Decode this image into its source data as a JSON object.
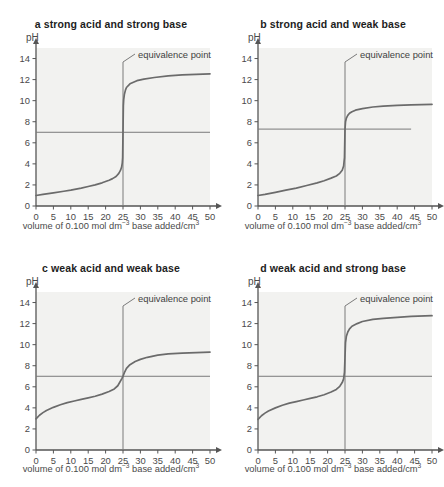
{
  "figure": {
    "axis_label_y": "pH",
    "axis_label_x_pre": "volume of 0.100 mol dm",
    "axis_label_x_sup": "−3",
    "axis_label_x_mid": " base added/cm",
    "axis_label_x_sup2": "3",
    "annotation": "equivalence point",
    "colors": {
      "plot_background": "#f2f2f0",
      "curve": "#6b6b6b",
      "axis": "#555555",
      "reference_line": "#7a7a7a",
      "title": "#1d1d1d",
      "tick_label": "#4a4a4a"
    }
  },
  "chart_data": [
    {
      "type": "line",
      "panel": "a",
      "title": "a strong acid and strong base",
      "xlabel": "volume of 0.100 mol dm-3 base added/cm3",
      "ylabel": "pH",
      "xlim": [
        0,
        50
      ],
      "ylim": [
        0,
        15
      ],
      "xticks": [
        0,
        5,
        10,
        15,
        20,
        25,
        30,
        35,
        40,
        45,
        50
      ],
      "yticks": [
        0,
        2,
        4,
        6,
        8,
        10,
        12,
        14
      ],
      "grid": false,
      "equivalence_point_volume": 25,
      "equivalence_point_ph": 7,
      "reference_line_ph": 7,
      "reference_line_x_end": 50,
      "annotation": "equivalence point",
      "x": [
        0,
        2,
        5,
        8,
        10,
        13,
        15,
        17,
        19,
        21,
        22,
        23,
        23.8,
        24.3,
        24.6,
        24.8,
        24.9,
        25,
        25.1,
        25.2,
        25.4,
        25.7,
        26,
        27,
        29,
        31,
        34,
        38,
        42,
        46,
        50
      ],
      "y": [
        1.0,
        1.1,
        1.25,
        1.4,
        1.5,
        1.7,
        1.85,
        2.0,
        2.2,
        2.45,
        2.6,
        2.8,
        3.1,
        3.4,
        3.7,
        4.1,
        4.6,
        7.0,
        9.5,
        10.1,
        10.6,
        11.0,
        11.25,
        11.6,
        11.9,
        12.05,
        12.2,
        12.35,
        12.45,
        12.5,
        12.55
      ]
    },
    {
      "type": "line",
      "panel": "b",
      "title": "b strong acid and weak base",
      "xlabel": "volume of 0.100 mol dm-3 base added/cm3",
      "ylabel": "pH",
      "xlim": [
        0,
        50
      ],
      "ylim": [
        0,
        15
      ],
      "xticks": [
        0,
        5,
        10,
        15,
        20,
        25,
        30,
        35,
        40,
        45,
        50
      ],
      "yticks": [
        0,
        2,
        4,
        6,
        8,
        10,
        12,
        14
      ],
      "grid": false,
      "equivalence_point_volume": 25,
      "equivalence_point_ph": 7.3,
      "reference_line_ph": 7.3,
      "reference_line_x_end": 44,
      "annotation": "equivalence point",
      "x": [
        0,
        2,
        5,
        8,
        11,
        14,
        17,
        19,
        21,
        22.5,
        23.5,
        24.2,
        24.6,
        24.85,
        25,
        25.15,
        25.4,
        25.8,
        26.3,
        27,
        28,
        30,
        33,
        36,
        40,
        44,
        47,
        50
      ],
      "y": [
        1.0,
        1.1,
        1.3,
        1.5,
        1.7,
        1.95,
        2.2,
        2.4,
        2.65,
        2.85,
        3.1,
        3.4,
        3.8,
        4.6,
        7.3,
        8.0,
        8.35,
        8.6,
        8.8,
        8.95,
        9.1,
        9.25,
        9.4,
        9.48,
        9.55,
        9.6,
        9.63,
        9.65
      ]
    },
    {
      "type": "line",
      "panel": "c",
      "title": "c weak acid and weak base",
      "xlabel": "volume of 0.100 mol dm-3 base added/cm3",
      "ylabel": "pH",
      "xlim": [
        0,
        50
      ],
      "ylim": [
        0,
        15
      ],
      "xticks": [
        0,
        5,
        10,
        15,
        20,
        25,
        30,
        35,
        40,
        45,
        50
      ],
      "yticks": [
        0,
        2,
        4,
        6,
        8,
        10,
        12,
        14
      ],
      "grid": false,
      "equivalence_point_volume": 25,
      "equivalence_point_ph": 7,
      "reference_line_ph": 7,
      "reference_line_x_end": 50,
      "annotation": "equivalence point",
      "x": [
        0,
        1,
        2,
        3,
        5,
        7,
        9,
        11,
        13,
        15,
        17,
        19,
        21,
        22.5,
        23.5,
        24.2,
        24.7,
        25,
        25.4,
        26,
        27,
        28.5,
        30,
        32,
        35,
        38,
        42,
        46,
        50
      ],
      "y": [
        2.95,
        3.3,
        3.55,
        3.75,
        4.05,
        4.3,
        4.5,
        4.65,
        4.8,
        4.95,
        5.1,
        5.3,
        5.55,
        5.8,
        6.1,
        6.5,
        6.8,
        7.0,
        7.35,
        7.75,
        8.1,
        8.4,
        8.6,
        8.8,
        9.0,
        9.12,
        9.2,
        9.25,
        9.3
      ]
    },
    {
      "type": "line",
      "panel": "d",
      "title": "d weak acid and strong base",
      "xlabel": "volume of 0.100 mol dm-3 base added/cm3",
      "ylabel": "pH",
      "xlim": [
        0,
        50
      ],
      "ylim": [
        0,
        15
      ],
      "xticks": [
        0,
        5,
        10,
        15,
        20,
        25,
        30,
        35,
        40,
        45,
        50
      ],
      "yticks": [
        0,
        2,
        4,
        6,
        8,
        10,
        12,
        14
      ],
      "grid": false,
      "equivalence_point_volume": 25,
      "equivalence_point_ph": 8.8,
      "reference_line_ph": 7,
      "reference_line_x_end": 50,
      "annotation": "equivalence point",
      "x": [
        0,
        1,
        2,
        3,
        5,
        7,
        9,
        11,
        13,
        15,
        17,
        19,
        21,
        22.5,
        23.5,
        24.2,
        24.6,
        24.85,
        25,
        25.15,
        25.4,
        25.8,
        26.3,
        27,
        28.5,
        30,
        33,
        36,
        40,
        44,
        48,
        50
      ],
      "y": [
        2.9,
        3.25,
        3.5,
        3.7,
        4.0,
        4.25,
        4.45,
        4.6,
        4.75,
        4.9,
        5.05,
        5.25,
        5.5,
        5.75,
        6.05,
        6.4,
        6.75,
        7.4,
        8.8,
        10.2,
        10.8,
        11.2,
        11.5,
        11.75,
        12.0,
        12.2,
        12.4,
        12.5,
        12.6,
        12.68,
        12.73,
        12.75
      ]
    }
  ]
}
